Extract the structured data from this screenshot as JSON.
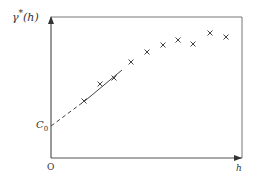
{
  "chart_data": {
    "type": "scatter",
    "title": "",
    "xlabel": "h",
    "ylabel": "γ*(h)",
    "origin_label": "O",
    "intercept_label": "C0",
    "intercept_main": "C",
    "intercept_sub": "0",
    "ylabel_main": "γ",
    "ylabel_sup": "*",
    "ylabel_arg": "(h)",
    "grid": false,
    "legend": null,
    "axes_ticks": "none",
    "points_px": [
      {
        "x": 84,
        "y": 101
      },
      {
        "x": 100,
        "y": 84
      },
      {
        "x": 114,
        "y": 78
      },
      {
        "x": 131,
        "y": 62
      },
      {
        "x": 147,
        "y": 52
      },
      {
        "x": 163,
        "y": 45
      },
      {
        "x": 178,
        "y": 40
      },
      {
        "x": 193,
        "y": 44
      },
      {
        "x": 210,
        "y": 33
      },
      {
        "x": 226,
        "y": 37
      }
    ],
    "series": [
      {
        "name": "experimental variogram",
        "marker": "x",
        "x": [
          1,
          2,
          3,
          4,
          5,
          6,
          7,
          8,
          9,
          10
        ],
        "values": [
          0.34,
          0.47,
          0.51,
          0.64,
          0.72,
          0.77,
          0.81,
          0.78,
          0.87,
          0.84
        ]
      }
    ],
    "fit_line": {
      "style": "solid",
      "from_px": [
        86,
        100
      ],
      "to_px": [
        122,
        70
      ]
    },
    "extrapolation": {
      "style": "dashed",
      "from_px": [
        51,
        126
      ],
      "to_px": [
        86,
        100
      ],
      "intercept": "C0"
    }
  }
}
